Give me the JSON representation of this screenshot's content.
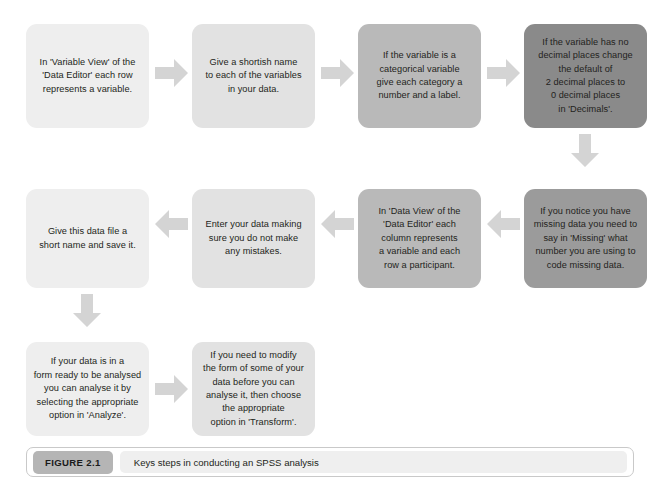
{
  "figure": {
    "badge": "FIGURE 2.1",
    "caption": "Keys steps in conducting an SPSS analysis"
  },
  "colors": {
    "tone_1": "#eeeeee",
    "tone_2": "#e2e2e2",
    "tone_3": "#d6d6d6",
    "tone_4": "#b9b9b9",
    "tone_5": "#9b9b9b",
    "tone_6": "#8a8a8a",
    "arrow": "#d2d2d2",
    "text": "#231f20",
    "badge": "#b5b5b5"
  },
  "flow": {
    "title": "Keys steps in conducting an SPSS analysis",
    "rows": [
      {
        "direction": "left-to-right",
        "steps": [
          {
            "id": "step-1",
            "tone": "tone-1",
            "text": "In 'Variable View' of the\n'Data Editor' each row\nrepresents a variable."
          },
          {
            "id": "step-2",
            "tone": "tone-2",
            "text": "Give a shortish name\nto each of the variables\nin your data."
          },
          {
            "id": "step-3",
            "tone": "tone-4",
            "text": "If the variable is a\ncategorical variable\ngive each category a\nnumber and a label."
          },
          {
            "id": "step-4",
            "tone": "tone-6",
            "text": "If the variable has no\ndecimal places change\nthe default of\n2 decimal places to\n0 decimal places\nin 'Decimals'."
          }
        ]
      },
      {
        "direction": "right-to-left",
        "steps": [
          {
            "id": "step-8",
            "tone": "tone-1",
            "text": "Give this data file a\nshort name and save it."
          },
          {
            "id": "step-7",
            "tone": "tone-2",
            "text": "Enter your data making\nsure you do not make\nany mistakes."
          },
          {
            "id": "step-6",
            "tone": "tone-4",
            "text": "In 'Data View' of the\n'Data Editor' each\ncolumn represents\na variable and each\nrow a participant."
          },
          {
            "id": "step-5",
            "tone": "tone-5",
            "text": "If you notice you have\nmissing data you need to\nsay in 'Missing' what\nnumber you are using to\ncode missing data."
          }
        ]
      },
      {
        "direction": "left-to-right",
        "steps": [
          {
            "id": "step-9",
            "tone": "tone-1",
            "text": "If your data is in a\nform ready to be analysed\nyou can analyse it by\nselecting the appropriate\noption in 'Analyze'."
          },
          {
            "id": "step-10",
            "tone": "tone-2",
            "text": "If you need to modify\nthe form of some of your\ndata before you can\nanalyse it, then choose\nthe appropriate\noption in 'Transform'."
          }
        ]
      }
    ],
    "connectors": [
      {
        "id": "arrow-step1-step2",
        "direction": "right"
      },
      {
        "id": "arrow-step2-step3",
        "direction": "right"
      },
      {
        "id": "arrow-step3-step4",
        "direction": "right"
      },
      {
        "id": "arrow-step4-step5",
        "direction": "down"
      },
      {
        "id": "arrow-step5-step6",
        "direction": "left"
      },
      {
        "id": "arrow-step6-step7",
        "direction": "left"
      },
      {
        "id": "arrow-step7-step8",
        "direction": "left"
      },
      {
        "id": "arrow-step8-step9",
        "direction": "down"
      },
      {
        "id": "arrow-step9-step10",
        "direction": "right"
      }
    ]
  }
}
